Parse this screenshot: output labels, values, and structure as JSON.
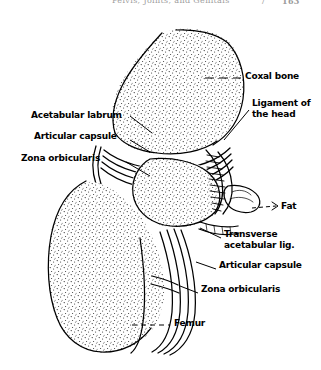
{
  "running_head": {
    "title": "Pelvis, Joints, and Genitals",
    "separator": "/",
    "page_number": "163"
  },
  "figure": {
    "caption": "",
    "labels": [
      {
        "id": "acetabular-labrum",
        "text": "Acetabular labrum",
        "side": "left",
        "x": 31,
        "y": 115,
        "leader": "solid"
      },
      {
        "id": "articular-capsule-left",
        "text": "Articular capsule",
        "side": "left",
        "x": 34,
        "y": 136,
        "leader": "solid"
      },
      {
        "id": "zona-orbicularis-left",
        "text": "Zona orbicularis",
        "side": "left",
        "x": 21,
        "y": 158,
        "leader": "solid"
      },
      {
        "id": "coxal-bone",
        "text": "Coxal bone",
        "side": "right",
        "x": 245,
        "y": 76,
        "leader": "dashed-dash"
      },
      {
        "id": "ligament-of-the-head",
        "text": "Ligament of\nthe head",
        "line1": "Ligament of",
        "line2": "the head",
        "side": "right",
        "x": 252,
        "y": 103,
        "leader": "solid"
      },
      {
        "id": "fat",
        "text": "Fat",
        "side": "right",
        "x": 281,
        "y": 206,
        "leader": "dashed-arrow"
      },
      {
        "id": "transverse-acetabular-lig",
        "text": "Transverse\nacetabular lig.",
        "line1": "Transverse",
        "line2": "acetabular lig.",
        "side": "right",
        "x": 224,
        "y": 234,
        "leader": "solid"
      },
      {
        "id": "articular-capsule-right",
        "text": "Articular capsule",
        "side": "right",
        "x": 219,
        "y": 265,
        "leader": "solid"
      },
      {
        "id": "zona-orbicularis-right",
        "text": "Zona orbicularis",
        "side": "right",
        "x": 201,
        "y": 289,
        "leader": "solid"
      },
      {
        "id": "femur",
        "text": "Femur",
        "side": "bottom",
        "x": 174,
        "y": 322,
        "leader": "dashed"
      }
    ],
    "colors": {
      "ink": "#000000",
      "paper": "#ffffff",
      "stipple": "#1a1a1a"
    }
  }
}
